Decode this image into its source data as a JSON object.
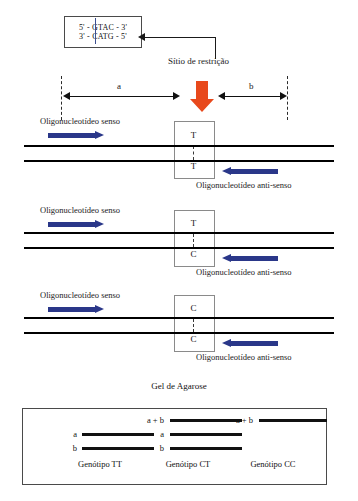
{
  "figure": {
    "colors": {
      "cut_arrow": "#e8491c",
      "primer_arrow": "#2a3789",
      "cut_line": "#3d4f8f",
      "strand": "#000000",
      "box_border": "#8a8a8a"
    }
  },
  "sequence_box": {
    "top_strand": "5' - GTAC - 3'",
    "bottom_strand": "3' - CATG - 5'"
  },
  "restriction": {
    "label": "Sítio de restrição"
  },
  "measures": {
    "segment_a": "a",
    "segment_b": "b"
  },
  "primers": {
    "sense": "Oligonucleotídeo senso",
    "antisense": "Oligonucleotídeo anti-senso"
  },
  "alleles": [
    {
      "id": "block-1",
      "top_base": "T",
      "bottom_base": "T"
    },
    {
      "id": "block-2",
      "top_base": "T",
      "bottom_base": "C"
    },
    {
      "id": "block-3",
      "top_base": "C",
      "bottom_base": "C"
    }
  ],
  "gel": {
    "title": "Gel de Agarose",
    "lanes": [
      {
        "genotype_label": "Genótipo TT",
        "bands": [
          {
            "label": "a"
          },
          {
            "label": "b"
          }
        ]
      },
      {
        "genotype_label": "Genótipo CT",
        "bands": [
          {
            "label": "a + b"
          },
          {
            "label": "a"
          },
          {
            "label": "b"
          }
        ]
      },
      {
        "genotype_label": "Genótipo CC",
        "bands": [
          {
            "label": "a + b"
          }
        ]
      }
    ]
  }
}
